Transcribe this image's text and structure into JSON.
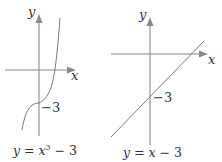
{
  "graphs": [
    {
      "id": "cubic",
      "equation": "y = x³ − 3",
      "caption_parts": {
        "y": "y",
        "eq": " = ",
        "x": "x",
        "exp": "3",
        "rest": " − 3"
      },
      "axis_labels": {
        "x": "x",
        "y": "y"
      },
      "intercept_label": "−3",
      "y_intercept": -3
    },
    {
      "id": "linear",
      "equation": "y = x − 3",
      "caption_parts": {
        "y": "y",
        "eq": " = ",
        "x": "x",
        "rest": " − 3"
      },
      "axis_labels": {
        "x": "x",
        "y": "y"
      },
      "intercept_label": "−3",
      "y_intercept": -3
    }
  ],
  "colors": {
    "axis": "#8a8a8a",
    "curve": "#7a7a7a",
    "text": "#333333"
  }
}
